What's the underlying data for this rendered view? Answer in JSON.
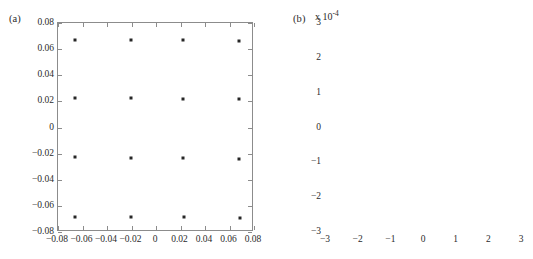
{
  "figure": {
    "panels": [
      {
        "id": "a",
        "label": "(a)",
        "multiplier": null
      },
      {
        "id": "b",
        "label": "(b)",
        "multiplier": "x 10",
        "multiplier_exponent": "-4"
      }
    ]
  },
  "chart_data": [
    {
      "type": "scatter",
      "panel": "a",
      "title": "(a)",
      "xlabel": "",
      "ylabel": "",
      "xlim": [
        -0.08,
        0.08
      ],
      "ylim": [
        -0.08,
        0.08
      ],
      "xticks": [
        -0.08,
        -0.06,
        -0.04,
        -0.02,
        0,
        0.02,
        0.04,
        0.06,
        0.08
      ],
      "xticklabels": [
        "-0.08",
        "-0.06",
        "-0.04",
        "-0.02",
        "0",
        "0.02",
        "0.04",
        "0.06",
        "0.08"
      ],
      "yticks": [
        -0.08,
        -0.06,
        -0.04,
        -0.02,
        0,
        0.02,
        0.04,
        0.06,
        0.08
      ],
      "yticklabels": [
        "-0.08",
        "-0.06",
        "-0.04",
        "-0.02",
        "0",
        "0.02",
        "0.04",
        "0.06",
        "0.08"
      ],
      "grid": false,
      "legend": null,
      "marker": "square",
      "marker_color": "#262626",
      "x": [
        -0.066,
        -0.0205,
        0.0222,
        0.068,
        -0.0662,
        -0.0208,
        0.022,
        0.0678,
        -0.0663,
        -0.0207,
        0.0222,
        0.068,
        -0.066,
        -0.0205,
        0.0225,
        0.0682
      ],
      "y": [
        0.0673,
        0.0673,
        0.067,
        0.0666,
        0.0224,
        0.0223,
        0.0219,
        0.0216,
        -0.0229,
        -0.023,
        -0.0235,
        -0.024,
        -0.0683,
        -0.0684,
        -0.0688,
        -0.0692
      ]
    },
    {
      "type": "scatter",
      "panel": "b",
      "title": "(b)",
      "xlabel": "",
      "ylabel": "",
      "axis_multiplier": "x 10^-4",
      "xlim": [
        -3,
        3
      ],
      "ylim": [
        -3,
        3
      ],
      "xticks": [
        -3,
        -2,
        -1,
        0,
        1,
        2,
        3
      ],
      "xticklabels": [
        "-3",
        "-2",
        "-1",
        "0",
        "1",
        "2",
        "3"
      ],
      "yticks": [
        -3,
        -2,
        -1,
        0,
        1,
        2,
        3
      ],
      "yticklabels": [
        "-3",
        "-2",
        "-1",
        "0",
        "1",
        "2",
        "3"
      ],
      "grid": false,
      "legend": null,
      "marker": "blob",
      "marker_color": "#262626",
      "x": [
        0.72,
        0.38,
        -0.62,
        -0.55,
        -0.32,
        0.15,
        0.05,
        -0.12,
        1.42,
        1.78,
        -1.28,
        -1.22,
        -0.98,
        -1.52,
        -1.48,
        -2.28,
        -2.08,
        0.3,
        0.42,
        0.88,
        1.3,
        0.22,
        -0.42,
        -0.72,
        -1.05,
        -1.35,
        -1.62,
        0.58,
        0.68,
        0.95,
        -0.08,
        -0.25,
        -0.52,
        -0.88,
        -1.18,
        1.55,
        1.72,
        2.05,
        2.35,
        -2.22,
        -1.92,
        -1.7,
        0.12,
        0.35,
        0.78,
        1.08,
        1.25,
        -0.18,
        -0.38,
        -0.65,
        -0.92,
        -1.12,
        -1.45,
        0.48,
        0.62,
        0.85,
        1.15,
        -0.05,
        -0.28,
        -0.48,
        -0.78,
        -1.02,
        -1.32,
        0.25,
        0.52,
        0.72,
        0.98,
        1.35,
        -0.15,
        -0.35,
        -0.58,
        -0.82,
        -1.08,
        -1.38,
        -1.58,
        0.18,
        0.45,
        0.65,
        0.92,
        1.18,
        1.48,
        -0.22,
        -0.45,
        -0.68,
        -0.95,
        -1.25,
        0.08,
        0.32,
        0.55,
        0.82,
        1.05,
        -0.02,
        -0.32,
        -0.62,
        -0.85,
        -1.15,
        0.28,
        0.48,
        0.75,
        1.02,
        -0.12,
        -0.42,
        -0.72,
        -1.0,
        0.38,
        0.58,
        0.88,
        -0.25,
        -0.55,
        -0.78,
        0.15,
        0.42,
        0.68,
        -0.35,
        -0.65,
        0.22,
        0.52,
        -0.45,
        1.62,
        -1.82,
        2.18,
        -2.12,
        0.05,
        -0.08,
        0.35,
        -0.28,
        0.62,
        -0.58,
        0.95,
        -0.92,
        1.28,
        -1.28,
        0.18,
        -0.18,
        0.48,
        -0.48,
        0.75,
        -0.75,
        1.45,
        -1.45,
        -0.68,
        0.68,
        0.02,
        -0.02
      ],
      "y": [
        2.3,
        2.12,
        -2.35,
        -2.05,
        2.02,
        1.92,
        1.88,
        1.72,
        1.48,
        1.42,
        1.52,
        1.28,
        1.32,
        1.18,
        0.98,
        0.68,
        0.95,
        1.02,
        0.88,
        1.2,
        1.08,
        0.72,
        0.85,
        0.62,
        0.55,
        0.45,
        0.15,
        0.78,
        0.68,
        0.58,
        0.48,
        0.35,
        0.28,
        0.18,
        0.08,
        0.38,
        0.42,
        0.28,
        -0.7,
        -0.42,
        -0.18,
        -0.32,
        0.12,
        0.22,
        0.02,
        -0.12,
        -0.28,
        -0.05,
        -0.15,
        -0.25,
        -0.35,
        -0.45,
        -0.55,
        -0.18,
        -0.32,
        -0.42,
        -0.52,
        -0.62,
        -0.72,
        -0.65,
        -0.58,
        -0.48,
        -0.38,
        -0.68,
        -0.78,
        -0.85,
        -0.72,
        -0.88,
        -0.82,
        -0.92,
        -0.78,
        -0.68,
        -0.58,
        -0.85,
        -0.95,
        -1.02,
        -0.95,
        -1.08,
        -0.88,
        -1.25,
        -1.32,
        -1.12,
        -1.05,
        -1.18,
        -1.28,
        -1.38,
        -1.42,
        -1.35,
        -1.48,
        -1.22,
        -1.52,
        -1.62,
        -1.58,
        -1.45,
        -1.68,
        -1.72,
        -1.82,
        -1.55,
        -1.65,
        -1.42,
        -1.92,
        -1.88,
        -1.78,
        -1.58,
        0.52,
        -0.08,
        0.32,
        0.45,
        0.22,
        0.05,
        0.65,
        -0.22,
        -0.48,
        0.92,
        0.75,
        1.12,
        0.18,
        1.38,
        -1.28,
        -0.32,
        0.38,
        0.48,
        -0.42,
        0.58,
        -1.15,
        1.62,
        -1.05,
        0.08,
        0.25,
        -0.62,
        -0.75,
        0.15,
        1.25,
        -0.95,
        0.85,
        -1.48,
        -0.52,
        0.95,
        -0.25,
        0.42,
        -2.08,
        -1.35,
        -0.02,
        0.32
      ]
    }
  ]
}
